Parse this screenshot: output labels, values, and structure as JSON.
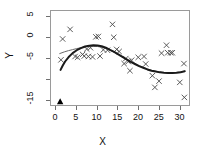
{
  "chart_data": {
    "type": "scatter",
    "title": "",
    "xlabel": "X",
    "ylabel": "Y",
    "xlim": [
      -1.2,
      32.5
    ],
    "ylim": [
      -16.5,
      6.5
    ],
    "xticks": [
      0,
      5,
      10,
      15,
      20,
      25,
      30
    ],
    "xticklabels": [
      "0",
      "5",
      "10",
      "15",
      "20",
      "25",
      "30"
    ],
    "yticks": [
      5,
      0,
      -5,
      -10,
      -15
    ],
    "yticklabels": [
      "5",
      "0",
      "-5",
      "",
      "-15"
    ],
    "grid": false,
    "legend": null,
    "series": [
      {
        "name": "observations",
        "type": "scatter",
        "marker": "x",
        "color": "#4a4a4a",
        "points": [
          [
            1.2,
            -5.2
          ],
          [
            1.6,
            -0.2
          ],
          [
            3.4,
            2.1
          ],
          [
            4.6,
            -4.4
          ],
          [
            5.2,
            -4.6
          ],
          [
            6.4,
            -3.9
          ],
          [
            6.8,
            -4.3
          ],
          [
            7.4,
            -2.6
          ],
          [
            7.8,
            -4.4
          ],
          [
            8.3,
            -2.3
          ],
          [
            8.8,
            -4.5
          ],
          [
            9.6,
            0.3
          ],
          [
            10.2,
            0.4
          ],
          [
            10.6,
            -4.3
          ],
          [
            11.4,
            -2.8
          ],
          [
            12.4,
            -2.9
          ],
          [
            13.6,
            3.3
          ],
          [
            13.9,
            0.2
          ],
          [
            14.6,
            -2.7
          ],
          [
            15.2,
            -3.2
          ],
          [
            16.4,
            -6.1
          ],
          [
            16.8,
            -4.9
          ],
          [
            17.4,
            -5.6
          ],
          [
            17.8,
            -7.8
          ],
          [
            18.2,
            -5.3
          ],
          [
            19.8,
            -4.6
          ],
          [
            21.2,
            -4.4
          ],
          [
            21.6,
            -6.2
          ],
          [
            23.2,
            -9.0
          ],
          [
            23.8,
            -11.8
          ],
          [
            24.8,
            -10.3
          ],
          [
            26.6,
            -1.7
          ],
          [
            25.4,
            -3.6
          ],
          [
            26.9,
            -3.5
          ],
          [
            27.6,
            -3.5
          ],
          [
            28.0,
            -3.5
          ],
          [
            29.8,
            -10.6
          ],
          [
            30.8,
            -6.1
          ],
          [
            30.9,
            -14.2
          ]
        ]
      },
      {
        "name": "fit-thin",
        "type": "line",
        "color": "#6b6b6b",
        "width": 1,
        "points": [
          [
            0.9,
            -3.7
          ],
          [
            2.0,
            -3.3
          ],
          [
            3.0,
            -3.0
          ],
          [
            4.0,
            -2.75
          ],
          [
            5.0,
            -2.5
          ],
          [
            6.0,
            -2.3
          ],
          [
            7.0,
            -2.1
          ],
          [
            8.0,
            -2.0
          ],
          [
            9.0,
            -1.95
          ],
          [
            10.0,
            -2.0
          ],
          [
            11.0,
            -2.2
          ],
          [
            12.0,
            -2.5
          ],
          [
            13.0,
            -2.9
          ],
          [
            14.0,
            -3.4
          ],
          [
            15.0,
            -3.9
          ],
          [
            16.0,
            -4.5
          ],
          [
            17.0,
            -5.1
          ],
          [
            18.0,
            -5.6
          ],
          [
            19.0,
            -6.1
          ],
          [
            20.0,
            -6.6
          ],
          [
            21.0,
            -7.0
          ],
          [
            22.0,
            -7.4
          ],
          [
            23.0,
            -7.7
          ],
          [
            24.0,
            -7.95
          ],
          [
            25.0,
            -8.1
          ],
          [
            26.0,
            -8.25
          ],
          [
            27.0,
            -8.3
          ],
          [
            28.0,
            -8.3
          ],
          [
            29.0,
            -8.25
          ],
          [
            30.0,
            -8.1
          ],
          [
            31.0,
            -7.9
          ]
        ]
      },
      {
        "name": "fit-thick",
        "type": "line",
        "color": "#1a1a1a",
        "width": 2,
        "points": [
          [
            1.1,
            -7.6
          ],
          [
            1.6,
            -6.6
          ],
          [
            2.2,
            -5.6
          ],
          [
            3.0,
            -4.6
          ],
          [
            4.0,
            -3.6
          ],
          [
            5.0,
            -2.9
          ],
          [
            6.0,
            -2.4
          ],
          [
            7.0,
            -2.0
          ],
          [
            8.0,
            -1.8
          ],
          [
            9.0,
            -1.7
          ],
          [
            10.0,
            -1.75
          ],
          [
            11.0,
            -1.95
          ],
          [
            12.0,
            -2.3
          ],
          [
            13.0,
            -2.8
          ],
          [
            14.0,
            -3.3
          ],
          [
            15.0,
            -3.9
          ],
          [
            16.0,
            -4.5
          ],
          [
            17.0,
            -5.1
          ],
          [
            18.0,
            -5.7
          ],
          [
            19.0,
            -6.2
          ],
          [
            20.0,
            -6.7
          ],
          [
            21.0,
            -7.1
          ],
          [
            22.0,
            -7.5
          ],
          [
            23.0,
            -7.8
          ],
          [
            24.0,
            -8.0
          ],
          [
            25.0,
            -8.2
          ],
          [
            26.0,
            -8.3
          ],
          [
            27.0,
            -8.35
          ],
          [
            28.0,
            -8.35
          ],
          [
            29.0,
            -8.3
          ],
          [
            30.0,
            -8.15
          ],
          [
            31.0,
            -7.95
          ]
        ]
      },
      {
        "name": "origin-marker",
        "type": "scatter",
        "marker": "triangle",
        "color": "#000000",
        "points": [
          [
            1.0,
            -15.2
          ]
        ]
      }
    ]
  }
}
